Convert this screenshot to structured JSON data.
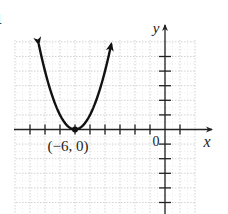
{
  "problem": {
    "number_fragment": "1"
  },
  "chart_data": {
    "type": "line",
    "title": "",
    "equation": "y = (x + 6)^2",
    "xlabel": "x",
    "ylabel": "y",
    "origin_label": "0",
    "xlim": [
      -10,
      2
    ],
    "ylim": [
      -5,
      6
    ],
    "x_ticks": [
      -9,
      -8,
      -7,
      -6,
      -5,
      -4,
      -3,
      -2,
      -1,
      1
    ],
    "y_ticks": [
      -5,
      -4,
      -3,
      -2,
      -1,
      1,
      2,
      3,
      4,
      5
    ],
    "grid": true,
    "legend": null,
    "series": [
      {
        "name": "parabola",
        "color": "#111111",
        "arrows_both_ends": true,
        "x": [
          -8.4,
          -8,
          -7.5,
          -7,
          -6.5,
          -6,
          -5.5,
          -5,
          -4.5,
          -4,
          -3.6
        ],
        "y": [
          5.8,
          4,
          2.25,
          1,
          0.25,
          0,
          0.25,
          1,
          2.25,
          4,
          5.8
        ]
      }
    ],
    "annotations": [
      {
        "text": "(−6, 0)",
        "point": [
          -6,
          0
        ],
        "marker": "dot",
        "position": "below"
      }
    ]
  },
  "colors": {
    "axis": "#222222",
    "grid": "#c8c8c8",
    "curve": "#111111",
    "background": "#ffffff"
  }
}
